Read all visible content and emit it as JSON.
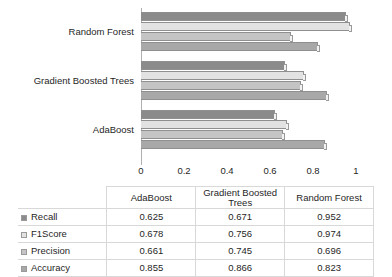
{
  "chart_data": {
    "type": "bar",
    "orientation": "horizontal",
    "title": "",
    "xlabel": "",
    "ylabel": "",
    "categories": [
      "AdaBoost",
      "Gradient Boosted Trees",
      "Random Forest"
    ],
    "series": [
      {
        "name": "Recall",
        "values": [
          0.625,
          0.671,
          0.952
        ],
        "color": "#8b8b8b"
      },
      {
        "name": "F1Score",
        "values": [
          0.678,
          0.756,
          0.974
        ],
        "color": "#e2e2e2"
      },
      {
        "name": "Precision",
        "values": [
          0.661,
          0.745,
          0.696
        ],
        "color": "#c4c4c4"
      },
      {
        "name": "Accuracy",
        "values": [
          0.855,
          0.866,
          0.823
        ],
        "color": "#a8a8a8"
      }
    ],
    "xlim": [
      0,
      1
    ],
    "xticks": [
      0,
      0.2,
      0.4,
      0.6,
      0.8,
      1
    ],
    "xtick_labels": [
      "0",
      "0.2",
      "0.4",
      "0.6",
      "0.8",
      "1"
    ],
    "grid": false,
    "legend_position": "data-table-row-headers",
    "category_order_top_to_bottom": [
      "Random Forest",
      "Gradient Boosted Trees",
      "AdaBoost"
    ],
    "series_order_top_to_bottom_within_group": [
      "Recall",
      "F1Score",
      "Precision",
      "Accuracy"
    ]
  },
  "table": {
    "corner_label": "",
    "column_headers": [
      "AdaBoost",
      "Gradient Boosted Trees",
      "Random Forest"
    ],
    "rows": [
      {
        "label": "Recall",
        "values": [
          "0.625",
          "0.671",
          "0.952"
        ]
      },
      {
        "label": "F1Score",
        "values": [
          "0.678",
          "0.756",
          "0.974"
        ]
      },
      {
        "label": "Precision",
        "values": [
          "0.661",
          "0.745",
          "0.696"
        ]
      },
      {
        "label": "Accuracy",
        "values": [
          "0.855",
          "0.866",
          "0.823"
        ]
      }
    ]
  },
  "axis": {
    "tick_labels": [
      "0",
      "0.2",
      "0.4",
      "0.6",
      "0.8",
      "1"
    ]
  },
  "category_labels": {
    "top": "Random Forest",
    "middle": "Gradient Boosted Trees",
    "bottom": "AdaBoost"
  }
}
